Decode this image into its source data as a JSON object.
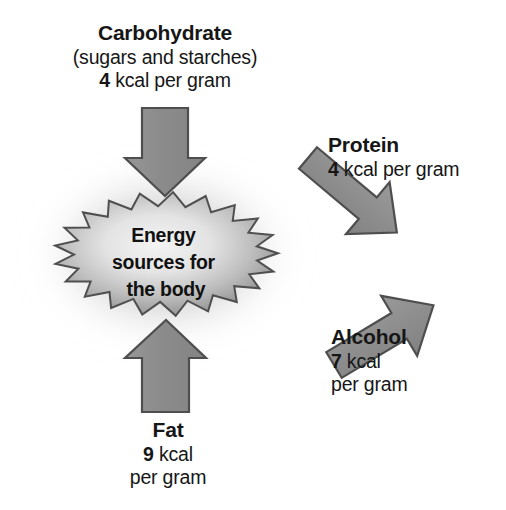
{
  "diagram": {
    "title": "Energy sources for the body",
    "center": {
      "lines": [
        "Energy",
        "sources for",
        "the body"
      ]
    },
    "colors": {
      "arrow_fill": "#8d8d8d",
      "arrow_stroke": "#4a4a4a",
      "burst_edge": "#8a8a8a",
      "burst_center": "#f0f0f0",
      "halo": "#b9b9b9",
      "text": "#161616",
      "background": "#ffffff"
    },
    "sources": [
      {
        "id": "carbohydrate",
        "name": "Carbohydrate",
        "note": "(sugars and starches)",
        "value": "4",
        "unit": "kcal per gram",
        "arrow_direction": "down",
        "value_lines": [
          "4 kcal per gram"
        ]
      },
      {
        "id": "protein",
        "name": "Protein",
        "note": "",
        "value": "4",
        "unit": "kcal per gram",
        "arrow_direction": "down-left",
        "value_lines": [
          "4 kcal per gram"
        ]
      },
      {
        "id": "alcohol",
        "name": "Alcohol",
        "note": "",
        "value": "7",
        "unit": "kcal per gram",
        "arrow_direction": "up-left",
        "value_lines": [
          "7 kcal",
          "per gram"
        ]
      },
      {
        "id": "fat",
        "name": "Fat",
        "note": "",
        "value": "9",
        "unit": "kcal per gram",
        "arrow_direction": "up",
        "value_lines": [
          "9 kcal",
          "per gram"
        ]
      }
    ]
  },
  "labels": {
    "carbohydrate": {
      "title": "Carbohydrate",
      "note": "(sugars and starches)",
      "value": "4",
      "unit": " kcal per gram"
    },
    "protein": {
      "title": "Protein",
      "value": "4",
      "unit": " kcal per gram"
    },
    "alcohol": {
      "title": "Alcohol",
      "value": "7",
      "unit": " kcal",
      "unit2": "per gram"
    },
    "fat": {
      "title": "Fat",
      "value": "9",
      "unit": " kcal",
      "unit2": "per gram"
    }
  },
  "center_text": {
    "line1": "Energy",
    "line2": "sources for",
    "line3": "the body"
  }
}
